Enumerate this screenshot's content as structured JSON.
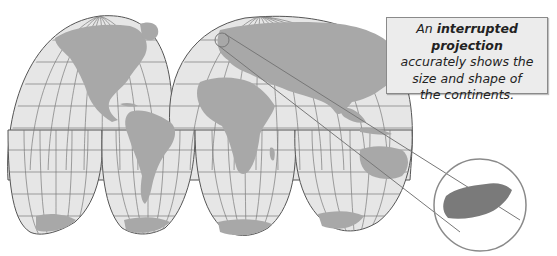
{
  "callout": {
    "line1_prefix": "An",
    "line1_bold": "interrupted projection",
    "line2": "accurately shows the",
    "line3": "size and shape of",
    "line4": "the continents."
  },
  "map": {
    "projection": "interrupted (Goode homolosine-style)",
    "lobes": 4,
    "colors": {
      "ocean": "#e6e6e6",
      "land": "#a8a8a8",
      "grid": "#6e6e6e",
      "outline": "#555555",
      "highlight_land": "#7a7a7a",
      "circle": "#8a8a8a"
    }
  }
}
